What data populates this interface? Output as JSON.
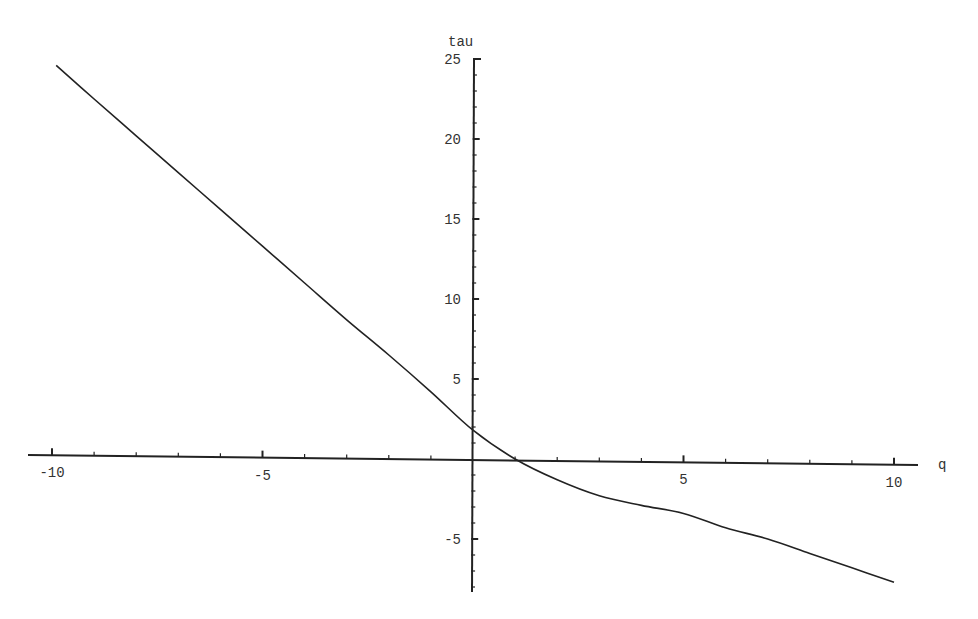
{
  "chart_data": {
    "type": "line",
    "title": "",
    "xlabel": "q",
    "ylabel": "tau",
    "xlim": [
      -10,
      10
    ],
    "ylim": [
      -8,
      25
    ],
    "grid": false,
    "legend": null,
    "x_ticks_major": [
      -10,
      -5,
      5,
      10
    ],
    "x_tick_labels": [
      "-10",
      "-5",
      "5",
      "10"
    ],
    "x_ticks_minor_step": 1,
    "y_ticks_major": [
      -5,
      5,
      10,
      15,
      20,
      25
    ],
    "y_tick_labels": [
      "-5",
      "5",
      "10",
      "15",
      "20",
      "25"
    ],
    "y_ticks_minor_step": 1,
    "series": [
      {
        "name": "tau(q)",
        "color": "#222222",
        "x": [
          -9.9,
          -9,
          -8,
          -7,
          -6,
          -5,
          -4,
          -3,
          -2,
          -1,
          0,
          1,
          2,
          3,
          4,
          5,
          6,
          7,
          8,
          9,
          10
        ],
        "values": [
          24.6,
          22.5,
          20.2,
          17.9,
          15.6,
          13.3,
          11.0,
          8.7,
          6.5,
          4.2,
          1.8,
          0.0,
          -1.3,
          -2.3,
          -2.9,
          -3.4,
          -4.3,
          -5.0,
          -5.9,
          -6.8,
          -7.7
        ]
      }
    ]
  },
  "labels": {
    "x_axis_name": "q",
    "y_axis_name": "tau"
  }
}
